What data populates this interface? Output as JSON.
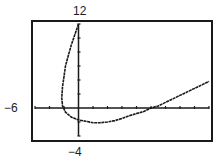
{
  "chart_data": {
    "type": "line",
    "title": "",
    "xlabel": "",
    "ylabel": "",
    "window": {
      "xmin": -6,
      "xmax": 18,
      "xscl": 2,
      "ymin": -4,
      "ymax": 12,
      "yscl": 2
    },
    "labels": {
      "ymax": "12",
      "xmin": "−6",
      "ymin": "−4"
    },
    "grid": false,
    "series": [
      {
        "name": "curve",
        "points": [
          [
            0,
            12
          ],
          [
            -0.5,
            10.5
          ],
          [
            -1,
            9
          ],
          [
            -1.4,
            7.5
          ],
          [
            -1.8,
            6
          ],
          [
            -2,
            4.5
          ],
          [
            -2.2,
            3
          ],
          [
            -2.3,
            1.5
          ],
          [
            -2.2,
            0.3
          ],
          [
            -1.8,
            -0.6
          ],
          [
            -1,
            -1.3
          ],
          [
            0,
            -1.7
          ],
          [
            1,
            -1.9
          ],
          [
            2,
            -2.1
          ],
          [
            3,
            -2.1
          ],
          [
            4,
            -2
          ],
          [
            5,
            -1.8
          ],
          [
            6,
            -1.5
          ],
          [
            7,
            -1.1
          ],
          [
            8,
            -0.8
          ],
          [
            9,
            -0.5
          ],
          [
            10,
            0
          ],
          [
            11,
            0.3
          ],
          [
            12,
            0.8
          ],
          [
            13,
            1.3
          ],
          [
            14,
            1.8
          ],
          [
            15,
            2.3
          ],
          [
            16,
            2.8
          ],
          [
            17,
            3.3
          ],
          [
            18,
            3.8
          ]
        ]
      }
    ]
  },
  "colors": {
    "ink": "#1a1a1a",
    "background": "#ffffff"
  }
}
